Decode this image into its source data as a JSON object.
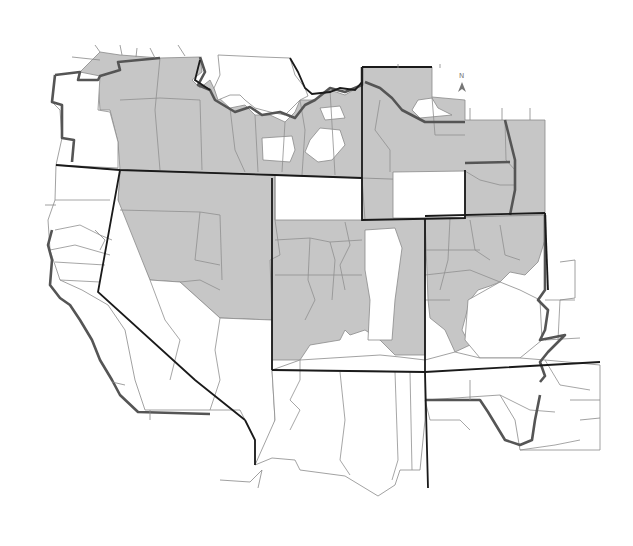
{
  "map": {
    "title": "",
    "type": "county choropleth (binary shading)",
    "legend": null,
    "colors": {
      "shaded": "#c6c6c6",
      "unshaded": "#ffffff",
      "state_border": "#1a1a1a",
      "coast_border": "#555555",
      "county_border": "#8a8a8a"
    },
    "north_arrow": {
      "label": "N"
    },
    "regions": [
      {
        "name": "northwest-shaded-belt",
        "shaded": true
      },
      {
        "name": "pacific-coast-northwest",
        "shaded": false
      },
      {
        "name": "great-basin-north-shaded",
        "shaded": true
      },
      {
        "name": "central-rockies-shaded",
        "shaded": true
      },
      {
        "name": "northern-plains-shaded",
        "shaded": true
      },
      {
        "name": "northern-plains-central-unshaded",
        "shaded": false
      },
      {
        "name": "southern-plains-shaded",
        "shaded": true
      },
      {
        "name": "pacific-coast-south",
        "shaded": false
      },
      {
        "name": "great-basin-south",
        "shaded": false
      },
      {
        "name": "southwest-desert",
        "shaded": false
      },
      {
        "name": "southern-plains-south",
        "shaded": false
      }
    ]
  }
}
